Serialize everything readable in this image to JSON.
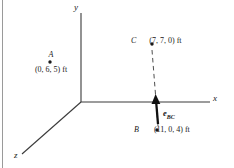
{
  "figure": {
    "background_color": "#ffffff",
    "line_color": "#3a3a3a",
    "rule_color": "#9a9a9a"
  },
  "axes": {
    "x_label": "x",
    "y_label": "y",
    "z_label": "z",
    "origin": {
      "x": 81,
      "y": 102
    }
  },
  "points": {
    "A": {
      "name": "A",
      "coords": "(0, 6, 5) ft",
      "dot": {
        "x": 50,
        "y": 62
      }
    },
    "B": {
      "name": "B",
      "coords": "(11, 0, 4) ft",
      "dot": {
        "x": 157,
        "y": 130
      }
    },
    "C": {
      "name": "C",
      "coords": "(7, 7, 0) ft",
      "dot": {
        "x": 152,
        "y": 44
      }
    }
  },
  "vector": {
    "label_base": "e",
    "label_sub": "BC"
  }
}
